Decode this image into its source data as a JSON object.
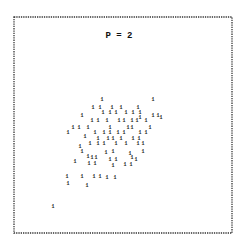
{
  "chart_data": {
    "type": "scatter",
    "title": "P = 2",
    "xlabel": "",
    "ylabel": "",
    "xlim": [
      0,
      100
    ],
    "ylim": [
      0,
      100
    ],
    "grid": false,
    "legend": "none",
    "marker": "1",
    "points": [
      [
        40.4,
        62.0
      ],
      [
        63.8,
        62.0
      ],
      [
        36.2,
        58.3
      ],
      [
        39.4,
        58.3
      ],
      [
        44.9,
        58.3
      ],
      [
        49.1,
        58.3
      ],
      [
        56.9,
        58.3
      ],
      [
        40.8,
        56.0
      ],
      [
        44.0,
        56.0
      ],
      [
        46.8,
        56.0
      ],
      [
        51.4,
        56.0
      ],
      [
        54.6,
        56.0
      ],
      [
        57.8,
        56.0
      ],
      [
        31.2,
        54.6
      ],
      [
        57.8,
        53.7
      ],
      [
        63.8,
        54.6
      ],
      [
        66.1,
        54.6
      ],
      [
        35.8,
        52.3
      ],
      [
        38.5,
        52.3
      ],
      [
        42.7,
        52.3
      ],
      [
        48.2,
        52.3
      ],
      [
        50.5,
        52.3
      ],
      [
        54.1,
        52.3
      ],
      [
        56.4,
        52.3
      ],
      [
        60.6,
        52.3
      ],
      [
        67.4,
        53.7
      ],
      [
        27.1,
        49.1
      ],
      [
        29.8,
        49.1
      ],
      [
        33.9,
        49.1
      ],
      [
        44.0,
        49.1
      ],
      [
        52.3,
        49.1
      ],
      [
        54.1,
        49.1
      ],
      [
        62.4,
        49.1
      ],
      [
        24.8,
        46.8
      ],
      [
        37.2,
        46.8
      ],
      [
        41.3,
        46.8
      ],
      [
        44.0,
        46.8
      ],
      [
        47.7,
        46.8
      ],
      [
        50.5,
        46.8
      ],
      [
        57.8,
        46.8
      ],
      [
        60.6,
        46.8
      ],
      [
        32.6,
        44.9
      ],
      [
        38.5,
        44.0
      ],
      [
        43.1,
        44.0
      ],
      [
        45.4,
        44.0
      ],
      [
        49.1,
        44.0
      ],
      [
        54.6,
        44.0
      ],
      [
        57.3,
        44.0
      ],
      [
        34.9,
        41.7
      ],
      [
        38.5,
        41.7
      ],
      [
        41.3,
        41.7
      ],
      [
        46.8,
        41.7
      ],
      [
        51.4,
        41.7
      ],
      [
        56.9,
        41.7
      ],
      [
        59.2,
        41.7
      ],
      [
        30.3,
        40.3
      ],
      [
        31.2,
        38.0
      ],
      [
        42.2,
        37.5
      ],
      [
        45.4,
        38.0
      ],
      [
        53.2,
        37.0
      ],
      [
        59.2,
        38.0
      ],
      [
        33.9,
        35.6
      ],
      [
        35.8,
        35.2
      ],
      [
        37.6,
        35.2
      ],
      [
        44.0,
        34.3
      ],
      [
        46.8,
        34.3
      ],
      [
        54.1,
        35.2
      ],
      [
        56.0,
        34.3
      ],
      [
        28.0,
        33.3
      ],
      [
        34.4,
        32.4
      ],
      [
        37.2,
        32.4
      ],
      [
        45.4,
        31.5
      ],
      [
        50.9,
        31.9
      ],
      [
        53.7,
        31.9
      ],
      [
        24.3,
        26.4
      ],
      [
        31.2,
        26.4
      ],
      [
        36.7,
        26.4
      ],
      [
        39.4,
        26.4
      ],
      [
        42.7,
        25.9
      ],
      [
        46.3,
        25.9
      ],
      [
        24.8,
        23.1
      ],
      [
        33.5,
        22.2
      ],
      [
        17.9,
        12.5
      ]
    ]
  }
}
